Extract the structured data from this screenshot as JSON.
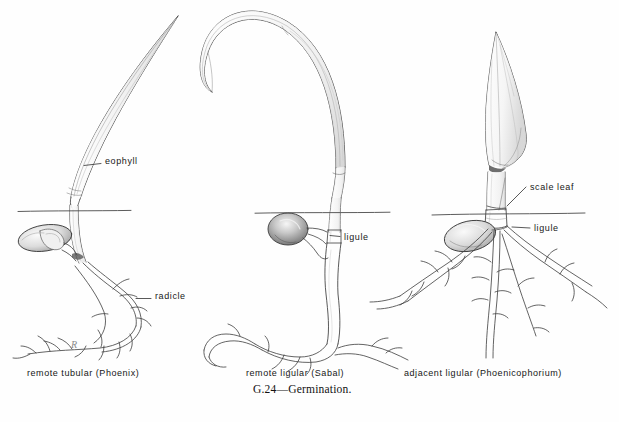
{
  "figure": {
    "caption": "G.24—Germination.",
    "caption_position": {
      "x": 253,
      "y": 389
    },
    "signature_mark": "R",
    "background_color": "#fefefe",
    "ink_color": "#3a3a3a",
    "ground_line_color": "#4a4a4a"
  },
  "panels": [
    {
      "id": "phoenix",
      "caption": "remote tubular  (Phoenix)",
      "caption_position": {
        "x": 27,
        "y": 373
      },
      "ground_line": {
        "x1": 18,
        "x2": 131,
        "y": 211
      },
      "labels": [
        {
          "name": "eophyll",
          "text": "eophyll",
          "text_position": {
            "x": 105,
            "y": 161
          },
          "leader": {
            "x1": 102,
            "y1": 164,
            "x2": 78,
            "y2": 167
          }
        },
        {
          "name": "radicle",
          "text": "radicle",
          "text_position": {
            "x": 155,
            "y": 296
          },
          "leader": {
            "x1": 152,
            "y1": 299,
            "x2": 138,
            "y2": 299
          }
        }
      ]
    },
    {
      "id": "sabal",
      "caption": "remote ligular  (Sabal)",
      "caption_position": {
        "x": 246,
        "y": 373
      },
      "ground_line": {
        "x1": 255,
        "x2": 390,
        "y": 213
      },
      "labels": [
        {
          "name": "ligule",
          "text": "ligule",
          "text_position": {
            "x": 343,
            "y": 239
          },
          "leader": {
            "x1": 340,
            "y1": 237,
            "x2": 330,
            "y2": 236
          }
        }
      ]
    },
    {
      "id": "phoenicophorium",
      "caption": "adjacent ligular  (Phoenicophorium)",
      "caption_position": {
        "x": 404,
        "y": 373
      },
      "ground_line": {
        "x1": 432,
        "x2": 585,
        "y": 214
      },
      "labels": [
        {
          "name": "scale-leaf",
          "text": "scale leaf",
          "text_position": {
            "x": 529,
            "y": 189
          },
          "leader": {
            "x1": 526,
            "y1": 188,
            "x2": 506,
            "y2": 205
          }
        },
        {
          "name": "ligule",
          "text": "ligule",
          "text_position": {
            "x": 533,
            "y": 231
          },
          "leader": {
            "x1": 530,
            "y1": 229,
            "x2": 517,
            "y2": 228
          }
        }
      ]
    }
  ]
}
